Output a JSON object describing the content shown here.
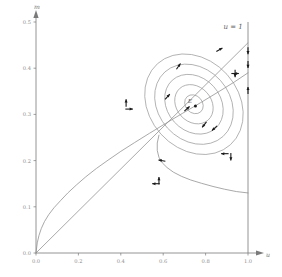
{
  "figure": {
    "title": "",
    "background_color": "#ffffff",
    "axis_color": "#7a7a7a",
    "curve_color": "#8c8c8c",
    "orbit_color": "#9a9a9a",
    "arrow_color": "#1a1a1a",
    "tick_label_color": "#8a8a8a"
  },
  "chart_data": {
    "type": "line",
    "title": "",
    "xlabel": "u",
    "ylabel": "m",
    "xlim": [
      0.0,
      1.0
    ],
    "ylim": [
      0.0,
      0.5
    ],
    "grid": false,
    "legend": "none",
    "xticks": [
      0.0,
      0.2,
      0.4,
      0.6,
      0.8,
      1.0
    ],
    "xtick_labels": [
      "0.0",
      "0.2",
      "0.4",
      "0.6",
      "0.8",
      "1.0"
    ],
    "yticks": [
      0.0,
      0.1,
      0.2,
      0.3,
      0.4,
      0.5
    ],
    "ytick_labels": [
      "0.0",
      "0.1",
      "0.2",
      "0.3",
      "0.4",
      "0.5"
    ],
    "annotations": [
      {
        "text": "u = 1",
        "x": 0.93,
        "y": 0.485,
        "name": "u-equals-one-label"
      },
      {
        "text": "E",
        "x": 0.745,
        "y": 0.325,
        "name": "equilibrium-point-label"
      }
    ],
    "series": [
      {
        "name": "nullcline-rising",
        "style": "solid",
        "points": [
          [
            0.0,
            0.0
          ],
          [
            0.006,
            0.022
          ],
          [
            0.014,
            0.038
          ],
          [
            0.025,
            0.053
          ],
          [
            0.04,
            0.068
          ],
          [
            0.06,
            0.083
          ],
          [
            0.085,
            0.098
          ],
          [
            0.115,
            0.113
          ],
          [
            0.15,
            0.13
          ],
          [
            0.19,
            0.147
          ],
          [
            0.235,
            0.165
          ],
          [
            0.285,
            0.183
          ],
          [
            0.34,
            0.201
          ],
          [
            0.4,
            0.22
          ],
          [
            0.465,
            0.239
          ],
          [
            0.535,
            0.259
          ],
          [
            0.61,
            0.28
          ],
          [
            0.69,
            0.302
          ],
          [
            0.775,
            0.325
          ],
          [
            0.865,
            0.35
          ],
          [
            0.935,
            0.37
          ],
          [
            1.0,
            0.39
          ]
        ]
      },
      {
        "name": "nullcline-descending",
        "style": "solid",
        "points": [
          [
            0.58,
            0.255
          ],
          [
            0.572,
            0.238
          ],
          [
            0.572,
            0.222
          ],
          [
            0.58,
            0.207
          ],
          [
            0.596,
            0.195
          ],
          [
            0.618,
            0.185
          ],
          [
            0.648,
            0.175
          ],
          [
            0.686,
            0.166
          ],
          [
            0.73,
            0.158
          ],
          [
            0.78,
            0.151
          ],
          [
            0.835,
            0.144
          ],
          [
            0.89,
            0.138
          ],
          [
            0.945,
            0.133
          ],
          [
            1.0,
            0.13
          ]
        ]
      },
      {
        "name": "separatrix-line",
        "style": "solid-straight",
        "points": [
          [
            0.0,
            0.0
          ],
          [
            1.0,
            0.455
          ]
        ]
      }
    ],
    "orbits": [
      {
        "name": "orbit-1",
        "cx": 0.745,
        "cy": 0.322,
        "rx": 0.04,
        "ry": 0.022,
        "rotation_deg": -42
      },
      {
        "name": "orbit-2",
        "cx": 0.745,
        "cy": 0.322,
        "rx": 0.082,
        "ry": 0.046,
        "rotation_deg": -42
      },
      {
        "name": "orbit-3",
        "cx": 0.745,
        "cy": 0.322,
        "rx": 0.125,
        "ry": 0.07,
        "rotation_deg": -42
      },
      {
        "name": "orbit-4",
        "cx": 0.745,
        "cy": 0.322,
        "rx": 0.168,
        "ry": 0.094,
        "rotation_deg": -42
      },
      {
        "name": "orbit-5",
        "cx": 0.745,
        "cy": 0.322,
        "rx": 0.21,
        "ry": 0.118,
        "rotation_deg": -42
      }
    ],
    "vertical_line": {
      "name": "u-equals-one-line",
      "x": 1.0,
      "y_from": 0.0,
      "y_to": 0.5
    },
    "direction_field_arrows": [
      {
        "name": "df-arrow-left-upper",
        "x": 0.425,
        "y": 0.318,
        "dirs": [
          "up",
          "right"
        ]
      },
      {
        "name": "df-arrow-lower-mid",
        "x": 0.58,
        "y": 0.15,
        "dirs": [
          "up",
          "left"
        ]
      },
      {
        "name": "df-arrow-right-lower",
        "x": 0.905,
        "y": 0.215,
        "dirs": [
          "left",
          "down"
        ]
      },
      {
        "name": "df-arrow-right-upper",
        "x": 0.925,
        "y": 0.395,
        "dirs": [
          "right",
          "down"
        ]
      }
    ],
    "boundary_flow_arrows": [
      {
        "name": "boundary-arrow-1",
        "x": 1.0,
        "y": 0.438,
        "dir": "down"
      },
      {
        "name": "boundary-arrow-2",
        "x": 1.0,
        "y": 0.408,
        "dir": "down"
      },
      {
        "name": "boundary-arrow-3",
        "x": 1.0,
        "y": 0.352,
        "dir": "up"
      }
    ],
    "orbit_flow_arrows": [
      {
        "name": "orbit-arrow-1",
        "x": 0.672,
        "y": 0.404,
        "angle_deg": -55
      },
      {
        "name": "orbit-arrow-2",
        "x": 0.62,
        "y": 0.338,
        "angle_deg": -48
      },
      {
        "name": "orbit-arrow-3",
        "x": 0.712,
        "y": 0.312,
        "angle_deg": -42
      },
      {
        "name": "orbit-arrow-4",
        "x": 0.794,
        "y": 0.278,
        "angle_deg": 128
      },
      {
        "name": "orbit-arrow-5",
        "x": 0.842,
        "y": 0.27,
        "angle_deg": 138
      },
      {
        "name": "orbit-arrow-6",
        "x": 0.594,
        "y": 0.2,
        "angle_deg": 190
      },
      {
        "name": "orbit-arrow-7",
        "x": 0.865,
        "y": 0.44,
        "angle_deg": -30
      }
    ]
  }
}
